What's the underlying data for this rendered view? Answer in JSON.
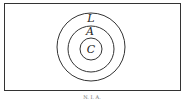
{
  "diagram": {
    "type": "nested-circles-venn",
    "universe_box": true,
    "circles": [
      {
        "label": "L",
        "role": "outer"
      },
      {
        "label": "A",
        "role": "middle"
      },
      {
        "label": "C",
        "role": "inner"
      }
    ],
    "caption": "N. I. A."
  }
}
